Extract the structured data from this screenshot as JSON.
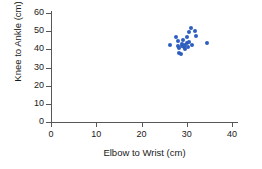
{
  "chart_data": {
    "type": "scatter",
    "title": "",
    "xlabel": "Elbow to Wrist (cm)",
    "ylabel": "Knee to Ankle (cm)",
    "xlim": [
      0,
      40
    ],
    "ylim": [
      0,
      60
    ],
    "xticks": [
      0,
      10,
      20,
      30,
      40
    ],
    "yticks": [
      0,
      10,
      20,
      30,
      40,
      50,
      60
    ],
    "xtick_labels": [
      "0",
      "10",
      "20",
      "30",
      "40"
    ],
    "ytick_labels": [
      "0",
      "10",
      "20",
      "30",
      "40",
      "50",
      "60"
    ],
    "grid": false,
    "legend": null,
    "marker_color": "#2E5FBF",
    "series": [
      {
        "name": "observations",
        "points": [
          {
            "x": 26.2,
            "y": 42.2
          },
          {
            "x": 27.6,
            "y": 46.8
          },
          {
            "x": 28.1,
            "y": 44.6
          },
          {
            "x": 28.0,
            "y": 42.1
          },
          {
            "x": 28.2,
            "y": 40.6
          },
          {
            "x": 28.3,
            "y": 38.2
          },
          {
            "x": 28.7,
            "y": 37.6
          },
          {
            "x": 28.9,
            "y": 41.8
          },
          {
            "x": 29.0,
            "y": 43.0
          },
          {
            "x": 29.2,
            "y": 45.4
          },
          {
            "x": 29.4,
            "y": 41.2
          },
          {
            "x": 29.6,
            "y": 42.6
          },
          {
            "x": 29.7,
            "y": 40.4
          },
          {
            "x": 30.0,
            "y": 46.6
          },
          {
            "x": 30.1,
            "y": 43.4
          },
          {
            "x": 30.2,
            "y": 41.4
          },
          {
            "x": 30.4,
            "y": 49.8
          },
          {
            "x": 30.6,
            "y": 44.2
          },
          {
            "x": 31.0,
            "y": 52.0
          },
          {
            "x": 31.2,
            "y": 42.4
          },
          {
            "x": 31.9,
            "y": 50.0
          },
          {
            "x": 32.0,
            "y": 47.2
          },
          {
            "x": 34.4,
            "y": 43.4
          }
        ]
      }
    ]
  }
}
